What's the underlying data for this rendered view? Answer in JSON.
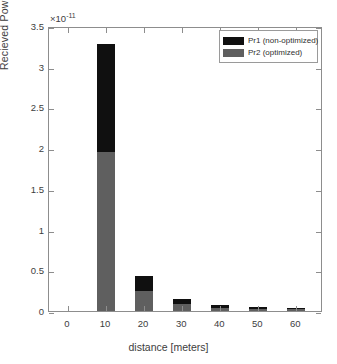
{
  "chart_data": {
    "type": "bar",
    "stacked": true,
    "title": "",
    "xlabel": "distance [meters]",
    "ylabel": "Recieved Power [Watts]",
    "exponent_label": "×10",
    "exponent_power": "-11",
    "y_scale_factor": 1e-11,
    "categories": [
      0,
      10,
      20,
      30,
      40,
      50,
      60
    ],
    "xtick_labels": [
      "0",
      "10",
      "20",
      "30",
      "40",
      "50",
      "60"
    ],
    "ytick_labels": [
      "0",
      "0.5",
      "1",
      "1.5",
      "2",
      "2.5",
      "3",
      "3.5"
    ],
    "ytick_values": [
      0,
      0.5,
      1,
      1.5,
      2,
      2.5,
      3,
      3.5
    ],
    "ylim": [
      0,
      3.5
    ],
    "xlim": [
      -5,
      67
    ],
    "grid": false,
    "legend_position": "top-right",
    "series": [
      {
        "name": "Pr1 (non-optimized)",
        "color": "#101010",
        "values": [
          0,
          3.28,
          0.43,
          0.15,
          0.07,
          0.05,
          0.04
        ],
        "note": "total stacked height"
      },
      {
        "name": "Pr2 (optimized)",
        "color": "#5f5f5f",
        "values": [
          0,
          1.95,
          0.24,
          0.09,
          0.04,
          0.03,
          0.02
        ],
        "note": "lower stacked segment"
      }
    ],
    "bars": [
      {
        "x": 0,
        "total": 0,
        "lower": 0
      },
      {
        "x": 10,
        "total": 3.28,
        "lower": 1.95
      },
      {
        "x": 20,
        "total": 0.43,
        "lower": 0.24
      },
      {
        "x": 30,
        "total": 0.15,
        "lower": 0.09
      },
      {
        "x": 40,
        "total": 0.07,
        "lower": 0.04
      },
      {
        "x": 50,
        "total": 0.05,
        "lower": 0.03
      },
      {
        "x": 60,
        "total": 0.04,
        "lower": 0.02
      }
    ]
  },
  "legend": {
    "entries": [
      {
        "label": "Pr1 (non-optimized)",
        "color": "#101010"
      },
      {
        "label": "Pr2 (optimized)",
        "color": "#5f5f5f"
      }
    ]
  },
  "colors": {
    "axis": "#8d8d8d",
    "text": "#3d3d3d",
    "background": "#ffffff",
    "series_black": "#101010",
    "series_gray": "#5f5f5f"
  }
}
